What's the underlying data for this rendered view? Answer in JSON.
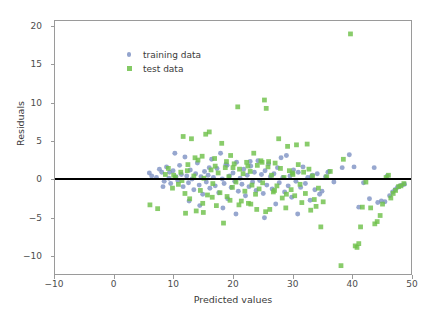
{
  "chart_data": {
    "type": "scatter",
    "title": "",
    "xlabel": "Predicted values",
    "ylabel": "Residuals",
    "xlim": [
      -10,
      50
    ],
    "ylim": [
      -12.5,
      20.8
    ],
    "xticks": [
      -10,
      0,
      10,
      20,
      30,
      40,
      50
    ],
    "yticks": [
      -10,
      -5,
      0,
      5,
      10,
      15,
      20
    ],
    "grid": false,
    "legend_position": "upper left",
    "reference_line": {
      "orientation": "horizontal",
      "y": 0,
      "color": "#000000",
      "width": 2
    },
    "series": [
      {
        "name": "training data",
        "marker": "circle",
        "color": "#8094c4",
        "points": [
          [
            5.9,
            0.8
          ],
          [
            6.3,
            0.4
          ],
          [
            7.1,
            0.2
          ],
          [
            7.6,
            1.3
          ],
          [
            8.0,
            0.9
          ],
          [
            8.4,
            -0.3
          ],
          [
            8.8,
            1.6
          ],
          [
            9.2,
            0.1
          ],
          [
            9.5,
            -0.6
          ],
          [
            9.9,
            1.1
          ],
          [
            10.2,
            3.4
          ],
          [
            10.4,
            0.3
          ],
          [
            10.7,
            -0.2
          ],
          [
            11.0,
            1.8
          ],
          [
            11.3,
            0.6
          ],
          [
            11.6,
            -1.0
          ],
          [
            11.9,
            2.9
          ],
          [
            12.2,
            0.4
          ],
          [
            12.5,
            -0.5
          ],
          [
            12.8,
            1.2
          ],
          [
            13.1,
            0.0
          ],
          [
            13.4,
            -1.4
          ],
          [
            13.7,
            0.7
          ],
          [
            14.0,
            2.1
          ],
          [
            14.3,
            -0.8
          ],
          [
            14.6,
            0.3
          ],
          [
            14.9,
            -2.0
          ],
          [
            15.2,
            1.0
          ],
          [
            15.5,
            -0.4
          ],
          [
            15.8,
            0.5
          ],
          [
            16.1,
            -1.2
          ],
          [
            16.4,
            2.6
          ],
          [
            16.7,
            0.2
          ],
          [
            17.0,
            -0.9
          ],
          [
            17.3,
            1.4
          ],
          [
            17.6,
            -1.8
          ],
          [
            17.9,
            3.4
          ],
          [
            18.2,
            0.0
          ],
          [
            18.5,
            -0.6
          ],
          [
            18.8,
            1.9
          ],
          [
            19.1,
            -2.6
          ],
          [
            19.4,
            0.4
          ],
          [
            19.7,
            -1.1
          ],
          [
            20.0,
            0.8
          ],
          [
            20.3,
            -0.3
          ],
          [
            20.6,
            2.2
          ],
          [
            20.9,
            -1.6
          ],
          [
            21.2,
            0.1
          ],
          [
            21.5,
            -0.7
          ],
          [
            21.8,
            1.3
          ],
          [
            22.1,
            -2.2
          ],
          [
            22.4,
            0.5
          ],
          [
            22.7,
            -1.0
          ],
          [
            23.0,
            1.7
          ],
          [
            23.3,
            -0.4
          ],
          [
            23.6,
            0.9
          ],
          [
            23.9,
            -1.5
          ],
          [
            24.2,
            2.4
          ],
          [
            24.5,
            -0.2
          ],
          [
            24.8,
            0.6
          ],
          [
            25.1,
            -1.9
          ],
          [
            25.4,
            1.1
          ],
          [
            25.7,
            -0.8
          ],
          [
            26.0,
            2.0
          ],
          [
            26.3,
            0.3
          ],
          [
            26.6,
            -1.3
          ],
          [
            26.9,
            0.7
          ],
          [
            27.2,
            -3.3
          ],
          [
            27.5,
            1.5
          ],
          [
            27.8,
            -0.5
          ],
          [
            28.1,
            2.8
          ],
          [
            28.4,
            0.2
          ],
          [
            28.7,
            -1.7
          ],
          [
            29.0,
            3.1
          ],
          [
            29.3,
            -0.9
          ],
          [
            29.6,
            0.4
          ],
          [
            29.9,
            -2.4
          ],
          [
            30.2,
            1.2
          ],
          [
            30.6,
            -0.3
          ],
          [
            31.0,
            0.9
          ],
          [
            31.4,
            -1.1
          ],
          [
            31.8,
            1.6
          ],
          [
            32.2,
            -0.6
          ],
          [
            32.6,
            0.2
          ],
          [
            33.0,
            -2.8
          ],
          [
            33.4,
            0.5
          ],
          [
            33.8,
            -1.4
          ],
          [
            34.2,
            0.7
          ],
          [
            34.6,
            -2.0
          ],
          [
            35.0,
            -1.6
          ],
          [
            35.6,
            0.3
          ],
          [
            36.2,
            1.0
          ],
          [
            37.0,
            -0.4
          ],
          [
            38.4,
            1.5
          ],
          [
            39.6,
            3.2
          ],
          [
            40.4,
            1.6
          ],
          [
            41.2,
            -3.7
          ],
          [
            42.0,
            -0.5
          ],
          [
            43.0,
            -2.6
          ],
          [
            43.8,
            1.5
          ],
          [
            44.4,
            -3.1
          ],
          [
            45.0,
            -2.9
          ],
          [
            45.6,
            -3.0
          ],
          [
            46.0,
            0.4
          ],
          [
            46.4,
            -2.2
          ],
          [
            46.9,
            -1.7
          ],
          [
            47.3,
            -1.4
          ],
          [
            47.7,
            -1.1
          ],
          [
            48.1,
            -0.9
          ],
          [
            48.5,
            -0.8
          ],
          [
            48.9,
            -0.7
          ],
          [
            20.5,
            -4.6
          ],
          [
            25.3,
            -5.1
          ],
          [
            18.3,
            -3.8
          ],
          [
            14.4,
            -3.5
          ],
          [
            30.9,
            -4.6
          ],
          [
            12.6,
            -2.9
          ],
          [
            9.3,
            0.9
          ],
          [
            8.2,
            -1.0
          ],
          [
            36.0,
            0.9
          ],
          [
            33.2,
            0.3
          ],
          [
            22.9,
            2.3
          ],
          [
            19.0,
            1.8
          ],
          [
            16.0,
            1.5
          ]
        ]
      },
      {
        "name": "test data",
        "marker": "square",
        "color": "#6fc14a",
        "points": [
          [
            6.0,
            -3.4
          ],
          [
            7.3,
            -3.9
          ],
          [
            8.6,
            0.6
          ],
          [
            9.1,
            1.4
          ],
          [
            9.8,
            -1.2
          ],
          [
            10.3,
            0.2
          ],
          [
            10.8,
            -0.7
          ],
          [
            11.2,
            0.9
          ],
          [
            11.6,
            5.6
          ],
          [
            11.9,
            -1.9
          ],
          [
            12.3,
            1.1
          ],
          [
            12.7,
            -2.6
          ],
          [
            13.0,
            5.3
          ],
          [
            13.4,
            0.4
          ],
          [
            13.8,
            -4.2
          ],
          [
            14.1,
            2.5
          ],
          [
            14.5,
            -1.5
          ],
          [
            14.8,
            3.0
          ],
          [
            15.1,
            0.1
          ],
          [
            15.4,
            5.9
          ],
          [
            15.7,
            -2.1
          ],
          [
            16.0,
            6.2
          ],
          [
            16.3,
            1.2
          ],
          [
            16.6,
            -0.6
          ],
          [
            16.9,
            2.7
          ],
          [
            17.2,
            -3.5
          ],
          [
            17.5,
            0.8
          ],
          [
            17.8,
            -1.8
          ],
          [
            18.1,
            4.7
          ],
          [
            18.4,
            -5.8
          ],
          [
            18.7,
            1.5
          ],
          [
            19.0,
            -2.3
          ],
          [
            19.3,
            0.3
          ],
          [
            19.6,
            3.1
          ],
          [
            19.9,
            -1.1
          ],
          [
            20.2,
            2.0
          ],
          [
            20.5,
            -0.4
          ],
          [
            20.8,
            9.5
          ],
          [
            21.1,
            1.3
          ],
          [
            21.4,
            -2.9
          ],
          [
            21.7,
            0.7
          ],
          [
            22.0,
            -1.6
          ],
          [
            22.3,
            2.2
          ],
          [
            22.6,
            -3.2
          ],
          [
            22.9,
            1.0
          ],
          [
            23.2,
            -0.8
          ],
          [
            23.5,
            3.4
          ],
          [
            23.8,
            -2.0
          ],
          [
            24.1,
            1.8
          ],
          [
            24.4,
            -1.3
          ],
          [
            24.7,
            2.4
          ],
          [
            25.0,
            -0.5
          ],
          [
            25.3,
            10.4
          ],
          [
            25.6,
            9.3
          ],
          [
            25.9,
            1.6
          ],
          [
            26.2,
            -4.0
          ],
          [
            26.5,
            0.5
          ],
          [
            26.8,
            -1.7
          ],
          [
            27.1,
            2.1
          ],
          [
            27.4,
            -0.9
          ],
          [
            27.7,
            5.3
          ],
          [
            28.0,
            1.4
          ],
          [
            28.3,
            -2.5
          ],
          [
            28.6,
            0.2
          ],
          [
            28.9,
            -3.8
          ],
          [
            29.2,
            4.3
          ],
          [
            29.5,
            1.1
          ],
          [
            29.8,
            -1.4
          ],
          [
            30.1,
            0.6
          ],
          [
            30.4,
            -2.2
          ],
          [
            30.7,
            4.5
          ],
          [
            31.0,
            1.9
          ],
          [
            31.3,
            -0.7
          ],
          [
            31.6,
            -3.1
          ],
          [
            31.9,
            0.9
          ],
          [
            32.2,
            -1.9
          ],
          [
            32.5,
            4.6
          ],
          [
            32.8,
            1.3
          ],
          [
            33.1,
            -4.1
          ],
          [
            33.4,
            0.4
          ],
          [
            33.7,
            -2.7
          ],
          [
            34.0,
            -3.6
          ],
          [
            34.4,
            -1.2
          ],
          [
            34.8,
            -6.3
          ],
          [
            35.2,
            -3.0
          ],
          [
            35.8,
            0.3
          ],
          [
            36.4,
            1.0
          ],
          [
            38.2,
            -11.4
          ],
          [
            38.6,
            2.6
          ],
          [
            39.8,
            19.1
          ],
          [
            40.6,
            -8.8
          ],
          [
            40.9,
            -9.0
          ],
          [
            41.2,
            -8.5
          ],
          [
            41.5,
            -6.3
          ],
          [
            41.8,
            -3.7
          ],
          [
            42.4,
            -0.4
          ],
          [
            43.2,
            -3.8
          ],
          [
            43.9,
            -5.9
          ],
          [
            44.3,
            -5.6
          ],
          [
            44.8,
            -4.8
          ],
          [
            45.2,
            -3.3
          ],
          [
            45.8,
            0.2
          ],
          [
            46.2,
            0.5
          ],
          [
            46.6,
            -2.5
          ],
          [
            47.0,
            -1.9
          ],
          [
            47.4,
            -1.5
          ],
          [
            47.9,
            -1.0
          ],
          [
            48.3,
            -0.9
          ],
          [
            48.8,
            -0.6
          ],
          [
            12.0,
            -4.5
          ],
          [
            15.0,
            -4.4
          ],
          [
            21.0,
            -3.4
          ],
          [
            23.0,
            -3.3
          ],
          [
            24.0,
            -4.0
          ],
          [
            25.5,
            -4.3
          ],
          [
            27.0,
            -1.5
          ],
          [
            29.0,
            -2.0
          ],
          [
            12.4,
            1.9
          ],
          [
            13.6,
            2.8
          ],
          [
            17.0,
            1.7
          ],
          [
            18.9,
            2.3
          ],
          [
            20.0,
            1.5
          ],
          [
            22.5,
            1.7
          ],
          [
            24.9,
            2.2
          ],
          [
            26.0,
            2.3
          ],
          [
            30.0,
            0.8
          ],
          [
            10.0,
            0.5
          ],
          [
            11.4,
            -0.2
          ],
          [
            19.5,
            -2.8
          ],
          [
            16.5,
            -2.4
          ],
          [
            14.9,
            -3.2
          ]
        ]
      }
    ]
  },
  "legend": {
    "entries": [
      {
        "label": "training data",
        "marker": "circle"
      },
      {
        "label": "test data",
        "marker": "square"
      }
    ]
  },
  "axis": {
    "x_tick_labels": [
      "-10",
      "0",
      "10",
      "20",
      "30",
      "40",
      "50"
    ],
    "y_tick_labels": [
      "20",
      "15",
      "10",
      "5",
      "0",
      "-5",
      "-10"
    ],
    "xlabel": "Predicted values",
    "ylabel": "Residuals"
  }
}
